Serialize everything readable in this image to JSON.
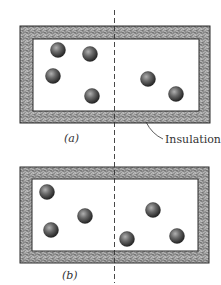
{
  "figure": {
    "panels": [
      {
        "label": "(a)",
        "box": {
          "outer": [
            20,
            26,
            210,
            123
          ],
          "inner": [
            33,
            39,
            199,
            111
          ]
        },
        "particles": [
          {
            "cx": 58,
            "cy": 50
          },
          {
            "cx": 90,
            "cy": 54
          },
          {
            "cx": 53,
            "cy": 76
          },
          {
            "cx": 92,
            "cy": 96
          },
          {
            "cx": 148,
            "cy": 79
          },
          {
            "cx": 176,
            "cy": 94
          }
        ],
        "label_pos": [
          70,
          141
        ]
      },
      {
        "label": "(b)",
        "box": {
          "outer": [
            20,
            167,
            209,
            263
          ],
          "inner": [
            32,
            179,
            198,
            251
          ]
        },
        "particles": [
          {
            "cx": 47,
            "cy": 192
          },
          {
            "cx": 85,
            "cy": 216
          },
          {
            "cx": 51,
            "cy": 230
          },
          {
            "cx": 153,
            "cy": 210
          },
          {
            "cx": 127,
            "cy": 239
          },
          {
            "cx": 177,
            "cy": 236
          }
        ],
        "label_pos": [
          70,
          277
        ]
      }
    ],
    "insulation_label": "Insulation",
    "divider": {
      "x": 114.5,
      "y1": 10,
      "y2": 283
    },
    "colors": {
      "insulation_fill": "#8a8a8a",
      "insulation_speckle": "#c8c8c8",
      "box_stroke": "#2a2a2a",
      "particle_dark": "#2e2e2e",
      "particle_light": "#9a9a9a",
      "divider": "#333333"
    }
  }
}
